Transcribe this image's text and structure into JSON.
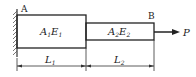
{
  "diagram": {
    "point_a": "A",
    "point_b": "B",
    "segment1": {
      "area": "A",
      "area_sub": "1",
      "modulus": "E",
      "modulus_sub": "1"
    },
    "segment2": {
      "area": "A",
      "area_sub": "2",
      "modulus": "E",
      "modulus_sub": "2"
    },
    "length1": {
      "symbol": "L",
      "sub": "1"
    },
    "length2": {
      "symbol": "L",
      "sub": "2"
    },
    "force": "P"
  }
}
